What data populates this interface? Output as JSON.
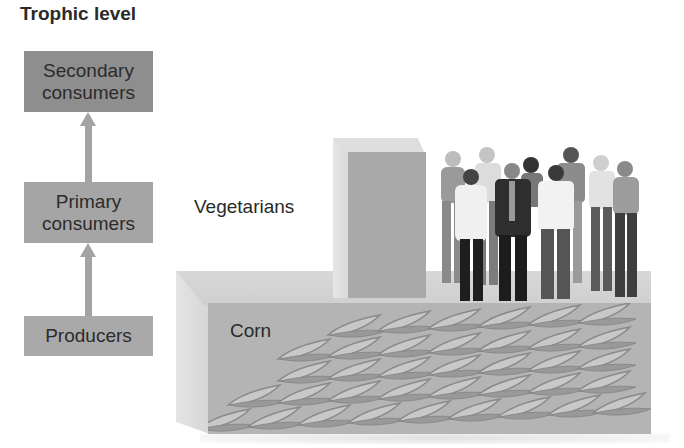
{
  "title": "Trophic level",
  "levels": [
    {
      "label": "Secondary consumers",
      "line1": "Secondary",
      "line2": "consumers",
      "shade": "#8e8e8e"
    },
    {
      "label": "Primary consumers",
      "line1": "Primary",
      "line2": "consumers",
      "shade": "#a5a5a5"
    },
    {
      "label": "Producers",
      "line1": "Producers",
      "shade": "#a9a9a9"
    }
  ],
  "arrows": [
    {
      "from": "Producers",
      "to": "Primary consumers"
    },
    {
      "from": "Primary consumers",
      "to": "Secondary consumers"
    }
  ],
  "pyramid": {
    "blocks": [
      {
        "name": "Corn",
        "label": "Corn",
        "trophic_level": "Producers",
        "relative_size": "large"
      },
      {
        "name": "Vegetarians",
        "label": "Vegetarians",
        "trophic_level": "Primary consumers",
        "relative_size": "small"
      }
    ],
    "people_count": 10,
    "corn_leaf_rows": 5
  }
}
